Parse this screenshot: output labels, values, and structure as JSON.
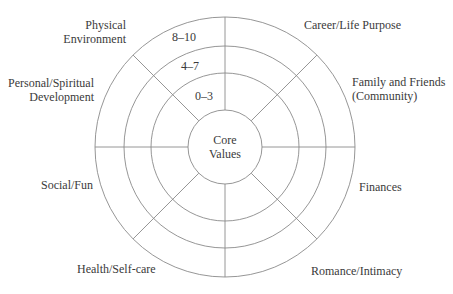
{
  "diagram": {
    "center": {
      "line1": "Core",
      "line2": "Values"
    },
    "scale_bands": [
      {
        "label": "0–3"
      },
      {
        "label": "4–7"
      },
      {
        "label": "8–10"
      }
    ],
    "segments": [
      {
        "line1": "Career/Life Purpose",
        "line2": ""
      },
      {
        "line1": "Family and Friends",
        "line2": "(Community)"
      },
      {
        "line1": "Finances",
        "line2": ""
      },
      {
        "line1": "Romance/Intimacy",
        "line2": ""
      },
      {
        "line1": "Health/Self-care",
        "line2": ""
      },
      {
        "line1": "Social/Fun",
        "line2": ""
      },
      {
        "line1": "Personal/Spiritual",
        "line2": "Development"
      },
      {
        "line1": "Physical",
        "line2": "Environment"
      }
    ],
    "colors": {
      "line": "#8a8a8a",
      "text": "#3a3a3a"
    }
  }
}
